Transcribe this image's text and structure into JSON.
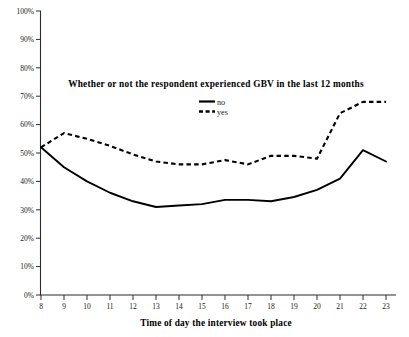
{
  "chart_data": {
    "type": "line",
    "title": "Whether or not the respondent experienced GBV in the last 12 months",
    "xlabel": "Time of day the interview took place",
    "ylabel": "",
    "x": [
      8,
      9,
      10,
      11,
      12,
      13,
      14,
      15,
      16,
      17,
      18,
      19,
      20,
      21,
      22,
      23
    ],
    "categories": [
      "8",
      "9",
      "10",
      "11",
      "12",
      "13",
      "14",
      "15",
      "16",
      "17",
      "18",
      "19",
      "20",
      "21",
      "22",
      "23"
    ],
    "xlim": [
      8,
      23
    ],
    "ylim": [
      0,
      100
    ],
    "yticks": [
      0,
      10,
      20,
      30,
      40,
      50,
      60,
      70,
      80,
      90,
      100
    ],
    "ytick_labels": [
      "0%",
      "10%",
      "20%",
      "30%",
      "40%",
      "50%",
      "60%",
      "70%",
      "80%",
      "90%",
      "100%"
    ],
    "grid": false,
    "legend_position": "upper-center",
    "series": [
      {
        "name": "no",
        "style": "solid",
        "color": "#000000",
        "values": [
          52,
          45,
          40,
          36,
          33,
          31,
          31.5,
          32,
          33.5,
          33.5,
          33,
          34.5,
          37,
          41,
          51,
          47
        ]
      },
      {
        "name": "yes",
        "style": "dashed",
        "color": "#000000",
        "values": [
          52,
          57,
          55,
          52.5,
          49.5,
          47,
          46,
          46,
          47.5,
          46,
          49,
          49,
          48,
          64,
          68,
          68
        ]
      }
    ]
  },
  "legend": {
    "items": [
      {
        "label": "no",
        "style": "solid"
      },
      {
        "label": "yes",
        "style": "dashed"
      }
    ]
  }
}
